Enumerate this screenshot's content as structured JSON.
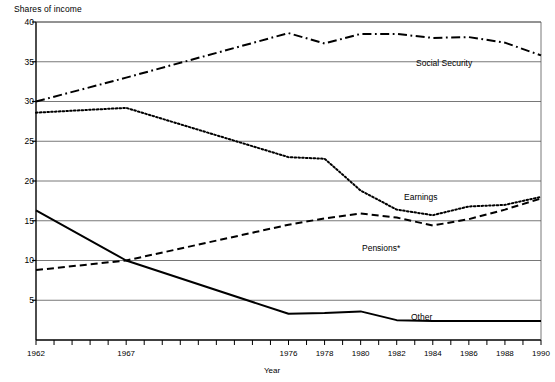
{
  "chart_data": {
    "type": "line",
    "title": "",
    "ylabel": "Shares of income",
    "xlabel": "Year",
    "ylim": [
      0,
      40
    ],
    "xlim": [
      1962,
      1990
    ],
    "grid": true,
    "grid_axis": "y",
    "legend_position": "inline-annotations",
    "y_ticks": [
      5,
      10,
      15,
      20,
      25,
      30,
      35,
      40
    ],
    "y_tick_labels": [
      "5",
      "10",
      "15",
      "20",
      "25",
      "30",
      "35",
      "40"
    ],
    "x_ticks": [
      1962,
      1963,
      1964,
      1965,
      1966,
      1967,
      1968,
      1969,
      1970,
      1971,
      1972,
      1973,
      1974,
      1975,
      1976,
      1977,
      1978,
      1979,
      1980,
      1981,
      1982,
      1983,
      1984,
      1985,
      1986,
      1987,
      1988,
      1989,
      1990
    ],
    "x_tick_labels": [
      "1962",
      "1967",
      "1976",
      "1978",
      "1980",
      "1982",
      "1984",
      "1986",
      "1988",
      "1990"
    ],
    "x_tick_label_years": [
      1962,
      1967,
      1976,
      1978,
      1980,
      1982,
      1984,
      1986,
      1988,
      1990
    ],
    "x": [
      1962,
      1967,
      1976,
      1978,
      1980,
      1982,
      1984,
      1986,
      1988,
      1990
    ],
    "series": [
      {
        "name": "Social Security",
        "style": "dash-dot",
        "color": "#000000",
        "values": [
          30.0,
          33.0,
          38.6,
          37.3,
          38.5,
          38.5,
          38.0,
          38.1,
          37.4,
          35.8
        ]
      },
      {
        "name": "Earnings",
        "style": "dotted",
        "color": "#000000",
        "values": [
          28.6,
          29.2,
          23.0,
          22.8,
          18.8,
          16.4,
          15.7,
          16.8,
          17.0,
          18.0
        ]
      },
      {
        "name": "Pensions*",
        "style": "dashed",
        "color": "#000000",
        "values": [
          8.8,
          10.0,
          14.5,
          15.3,
          15.9,
          15.4,
          14.4,
          15.2,
          16.4,
          17.8
        ]
      },
      {
        "name": "Other",
        "style": "solid",
        "color": "#000000",
        "values": [
          16.3,
          10.0,
          3.3,
          3.4,
          3.6,
          2.5,
          2.4,
          2.4,
          2.4,
          2.4
        ]
      }
    ],
    "annotations": [
      {
        "text": "Social Security",
        "x_px": 416,
        "y_px": 58
      },
      {
        "text": "Earnings",
        "x_px": 404,
        "y_px": 192
      },
      {
        "text": "Pensions*",
        "x_px": 362,
        "y_px": 243
      },
      {
        "text": "Other",
        "x_px": 411,
        "y_px": 312
      }
    ]
  }
}
